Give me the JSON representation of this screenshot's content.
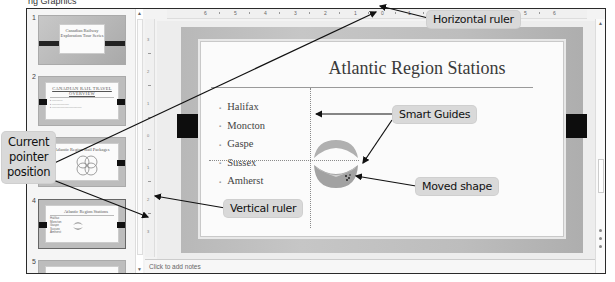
{
  "top_strip": {
    "text": "ng Graphics"
  },
  "thumbnails": [
    {
      "number": "1",
      "title": "Canadian Railway Exploration Tour Series",
      "bullets": []
    },
    {
      "number": "2",
      "title": "CANADIAN RAIL TRAVEL OVERVIEW",
      "bullets": [
        "•",
        "•",
        "•",
        "•",
        "•"
      ]
    },
    {
      "number": "3",
      "title": "Atlantic Region Rail Packages",
      "bullets": []
    },
    {
      "number": "4",
      "title": "Atlantic Region Stations",
      "bullets": [
        "Halifax",
        "Moncton",
        "Gaspe",
        "Sussex",
        "Amherst"
      ]
    },
    {
      "number": "5",
      "title": "",
      "bullets": []
    }
  ],
  "horizontal_ruler": {
    "labels": [
      "6",
      "5",
      "4",
      "3",
      "2",
      "1",
      "0",
      "1",
      "2",
      "3",
      "4",
      "5",
      "6"
    ]
  },
  "vertical_ruler": {
    "labels": [
      "3",
      "2",
      "1",
      "0",
      "1",
      "2",
      "3"
    ]
  },
  "slide": {
    "title": "Atlantic Region Stations",
    "bullets": [
      "Halifax",
      "Moncton",
      "Gaspe",
      "Sussex",
      "Amherst"
    ]
  },
  "notes": {
    "placeholder": "Click to add notes"
  },
  "callouts": {
    "horizontal_ruler": "Horizontal ruler",
    "smart_guides": "Smart Guides",
    "current_pointer_line1": "Current",
    "current_pointer_line2": "pointer",
    "current_pointer_line3": "position",
    "moved_shape": "Moved shape",
    "vertical_ruler": "Vertical ruler"
  },
  "colors": {
    "callout_bg": "#d9d9d9",
    "slide_border": "#bdbdbd",
    "side_block": "#0d0d0d",
    "shape_fill": "#a8a8a8"
  }
}
